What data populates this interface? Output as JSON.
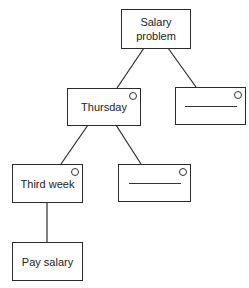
{
  "diagram": {
    "type": "tree",
    "nodes": [
      {
        "id": "root",
        "label": "Salary problem",
        "label_lines": [
          "Salary",
          "problem"
        ],
        "has_circle": false,
        "blank": false
      },
      {
        "id": "thursday",
        "label": "Thursday",
        "has_circle": true,
        "blank": false
      },
      {
        "id": "blank1",
        "label": "",
        "has_circle": true,
        "blank": true
      },
      {
        "id": "thirdweek",
        "label": "Third week",
        "has_circle": true,
        "blank": false
      },
      {
        "id": "blank2",
        "label": "",
        "has_circle": true,
        "blank": true
      },
      {
        "id": "paysalary",
        "label": "Pay salary",
        "has_circle": false,
        "blank": false
      }
    ],
    "edges": [
      {
        "from": "root",
        "to": "thursday"
      },
      {
        "from": "root",
        "to": "blank1"
      },
      {
        "from": "thursday",
        "to": "thirdweek"
      },
      {
        "from": "thursday",
        "to": "blank2"
      },
      {
        "from": "thirdweek",
        "to": "paysalary"
      }
    ]
  },
  "colors": {
    "line": "#2a2a2a",
    "background": "#ffffff"
  }
}
